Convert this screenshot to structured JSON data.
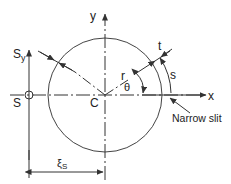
{
  "diagram": {
    "labels": {
      "y_axis": "y",
      "x_axis": "x",
      "shear_force": "S",
      "shear_force_sub": "y",
      "shear_center": "S",
      "centroid": "C",
      "radius": "r",
      "angle": "θ",
      "thickness": "t",
      "arc_length": "s",
      "slit": "Narrow slit",
      "distance": "ξ",
      "distance_sub": "S"
    },
    "colors": {
      "line": "#333333",
      "background": "#ffffff"
    }
  }
}
